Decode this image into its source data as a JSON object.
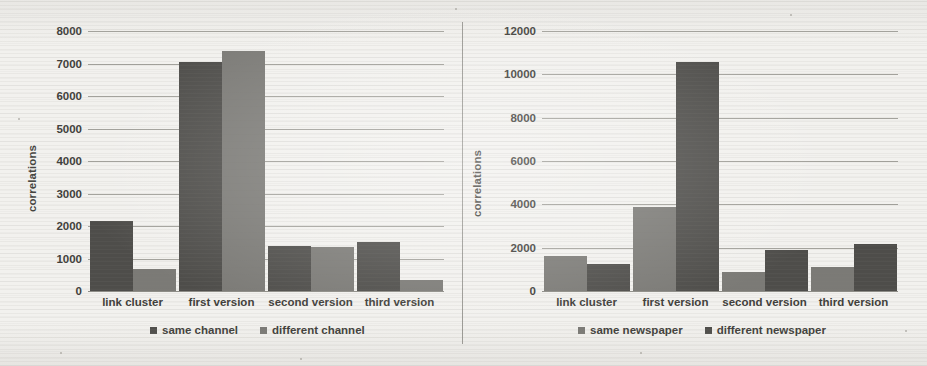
{
  "figure": {
    "background_color": "#f2f1ee",
    "series_colors": {
      "dark": "#4e4d4a",
      "light": "#7b7a76"
    }
  },
  "chart_data": [
    {
      "type": "bar",
      "panel": "left",
      "title": "",
      "xlabel": "",
      "ylabel": "correlations",
      "ylim": [
        0,
        8000
      ],
      "ytick_values": [
        0,
        1000,
        2000,
        3000,
        4000,
        5000,
        6000,
        7000,
        8000
      ],
      "ytick_labels": [
        "0",
        "1000",
        "2000",
        "3000",
        "4000",
        "5000",
        "6000",
        "7000",
        "8000"
      ],
      "grid": true,
      "legend_position": "bottom",
      "categories": [
        "link cluster",
        "first version",
        "second version",
        "third version"
      ],
      "series": [
        {
          "name": "same channel",
          "color": "#4e4d4a",
          "values": [
            2150,
            7050,
            1400,
            1520
          ]
        },
        {
          "name": "different channel",
          "color": "#7b7a76",
          "values": [
            680,
            7400,
            1350,
            330
          ]
        }
      ]
    },
    {
      "type": "bar",
      "panel": "right",
      "title": "",
      "xlabel": "",
      "ylabel": "correlations",
      "ylim": [
        0,
        12000
      ],
      "ytick_values": [
        0,
        2000,
        4000,
        6000,
        8000,
        10000,
        12000
      ],
      "ytick_labels": [
        "0",
        "2000",
        "4000",
        "6000",
        "8000",
        "10000",
        "12000"
      ],
      "grid": true,
      "legend_position": "bottom",
      "categories": [
        "link cluster",
        "first version",
        "second version",
        "third version"
      ],
      "series": [
        {
          "name": "same newspaper",
          "color": "#7b7a76",
          "values": [
            1600,
            3900,
            900,
            1100
          ]
        },
        {
          "name": "different newspaper",
          "color": "#4e4d4a",
          "values": [
            1250,
            10550,
            1900,
            2150
          ]
        }
      ]
    }
  ]
}
